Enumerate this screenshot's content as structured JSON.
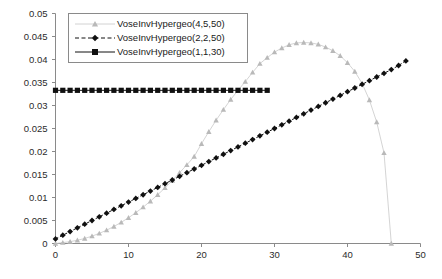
{
  "chart_data": {
    "type": "line",
    "title": "",
    "xlabel": "",
    "ylabel": "",
    "xlim": [
      0,
      50
    ],
    "ylim": [
      0,
      0.05
    ],
    "grid": false,
    "legend_position": "top-left",
    "x_ticks": [
      "0",
      "10",
      "20",
      "30",
      "40",
      "50"
    ],
    "x_tick_values": [
      0,
      10,
      20,
      30,
      40,
      50
    ],
    "y_ticks": [
      "0",
      "0.005",
      "0.01",
      "0.015",
      "0.02",
      "0.025",
      "0.03",
      "0.035",
      "0.04",
      "0.045",
      "0.05"
    ],
    "y_tick_values": [
      0,
      0.005,
      0.01,
      0.015,
      0.02,
      0.025,
      0.03,
      0.035,
      0.04,
      0.045,
      0.05
    ],
    "series": [
      {
        "name": "VoseInvHypergeo(4,5,50)",
        "marker": "triangle",
        "color": "#b9b9b9",
        "line_style": "solid",
        "x": [
          0,
          1,
          2,
          3,
          4,
          5,
          6,
          7,
          8,
          9,
          10,
          11,
          12,
          13,
          14,
          15,
          16,
          17,
          18,
          19,
          20,
          21,
          22,
          23,
          24,
          25,
          26,
          27,
          28,
          29,
          30,
          31,
          32,
          33,
          34,
          35,
          36,
          37,
          38,
          39,
          40,
          41,
          42,
          43,
          44,
          45,
          46
        ],
        "values": [
          0.0,
          0.0002,
          0.0004,
          0.0007,
          0.0011,
          0.0016,
          0.0022,
          0.0029,
          0.0037,
          0.0046,
          0.0056,
          0.0067,
          0.0079,
          0.0092,
          0.0106,
          0.0121,
          0.0137,
          0.0154,
          0.0171,
          0.0189,
          0.0217,
          0.0243,
          0.0268,
          0.0291,
          0.0313,
          0.0333,
          0.0352,
          0.0372,
          0.0391,
          0.0404,
          0.0416,
          0.0425,
          0.0432,
          0.0436,
          0.0437,
          0.0436,
          0.0433,
          0.0427,
          0.0419,
          0.0408,
          0.0393,
          0.0374,
          0.0348,
          0.0312,
          0.0264,
          0.0197,
          0.0
        ]
      },
      {
        "name": "VoseInvHypergeo(2,2,50)",
        "marker": "diamond",
        "color": "#101010",
        "line_style": "dashed",
        "x": [
          0,
          1,
          2,
          3,
          4,
          5,
          6,
          7,
          8,
          9,
          10,
          11,
          12,
          13,
          14,
          15,
          16,
          17,
          18,
          19,
          20,
          21,
          22,
          23,
          24,
          25,
          26,
          27,
          28,
          29,
          30,
          31,
          32,
          33,
          34,
          35,
          36,
          37,
          38,
          39,
          40,
          41,
          42,
          43,
          44,
          45,
          46,
          47,
          48
        ],
        "values": [
          0.001,
          0.0018,
          0.0026,
          0.0034,
          0.0042,
          0.005,
          0.0058,
          0.0066,
          0.0074,
          0.0082,
          0.009,
          0.0098,
          0.0106,
          0.0114,
          0.0122,
          0.013,
          0.0138,
          0.0146,
          0.0154,
          0.0162,
          0.017,
          0.0178,
          0.0186,
          0.0194,
          0.0202,
          0.021,
          0.0218,
          0.0226,
          0.0234,
          0.0242,
          0.025,
          0.0258,
          0.0266,
          0.0274,
          0.0282,
          0.029,
          0.0298,
          0.0306,
          0.0314,
          0.0322,
          0.033,
          0.0338,
          0.0346,
          0.0354,
          0.0362,
          0.037,
          0.0378,
          0.0387,
          0.0397
        ]
      },
      {
        "name": "VoseInvHypergeo(1,1,30)",
        "marker": "square",
        "color": "#101010",
        "line_style": "solid",
        "x": [
          0,
          1,
          2,
          3,
          4,
          5,
          6,
          7,
          8,
          9,
          10,
          11,
          12,
          13,
          14,
          15,
          16,
          17,
          18,
          19,
          20,
          21,
          22,
          23,
          24,
          25,
          26,
          27,
          28,
          29
        ],
        "values": [
          0.0333,
          0.0333,
          0.0333,
          0.0333,
          0.0333,
          0.0333,
          0.0333,
          0.0333,
          0.0333,
          0.0333,
          0.0333,
          0.0333,
          0.0333,
          0.0333,
          0.0333,
          0.0333,
          0.0333,
          0.0333,
          0.0333,
          0.0333,
          0.0333,
          0.0333,
          0.0333,
          0.0333,
          0.0333,
          0.0333,
          0.0333,
          0.0333,
          0.0333,
          0.0333
        ]
      }
    ]
  },
  "colors": {
    "axis": "#8a8a8a",
    "text": "#2b2b2b",
    "background": "#ffffff"
  }
}
